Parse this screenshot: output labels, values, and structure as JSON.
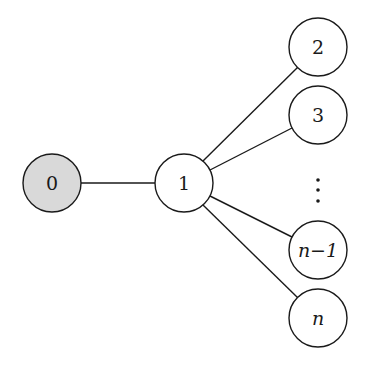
{
  "diagram": {
    "type": "star-graph",
    "colors": {
      "stroke": "#1a1a1a",
      "highlight_fill": "#d9d9d9",
      "node_fill": "#ffffff"
    },
    "nodes": [
      {
        "id": "0",
        "label": "0",
        "x": 52,
        "y": 183,
        "highlighted": true,
        "italic": false
      },
      {
        "id": "1",
        "label": "1",
        "x": 184,
        "y": 183,
        "highlighted": false,
        "italic": false
      },
      {
        "id": "2",
        "label": "2",
        "x": 318,
        "y": 47,
        "highlighted": false,
        "italic": false
      },
      {
        "id": "3",
        "label": "3",
        "x": 318,
        "y": 115,
        "highlighted": false,
        "italic": false
      },
      {
        "id": "n-1",
        "label": "n−1",
        "x": 318,
        "y": 250,
        "highlighted": false,
        "italic": true
      },
      {
        "id": "n",
        "label": "n",
        "x": 318,
        "y": 318,
        "highlighted": false,
        "italic": true
      }
    ],
    "edges": [
      {
        "from": "0",
        "to": "1"
      },
      {
        "from": "1",
        "to": "2"
      },
      {
        "from": "1",
        "to": "3"
      },
      {
        "from": "1",
        "to": "n-1"
      },
      {
        "from": "1",
        "to": "n"
      }
    ],
    "ellipsis": {
      "symbol": "vertical-dots",
      "x": 318,
      "y": [
        180,
        190,
        201
      ]
    },
    "node_radius": 29
  }
}
